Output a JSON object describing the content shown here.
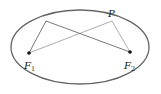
{
  "diagram": {
    "type": "ellipse-foci",
    "ellipse": {
      "cx": 80,
      "cy": 47,
      "rx": 69,
      "ry": 37,
      "stroke": "#666666"
    },
    "points": {
      "F1": {
        "x": 29,
        "y": 53,
        "label": "F",
        "subscript": "1"
      },
      "F2": {
        "x": 130,
        "y": 52,
        "label": "F",
        "subscript": "2"
      },
      "P": {
        "x": 112,
        "y": 21,
        "label": "P"
      },
      "Q": {
        "x": 46,
        "y": 21
      }
    },
    "segments": [
      [
        "F1",
        "Q"
      ],
      [
        "Q",
        "F2"
      ],
      [
        "F1",
        "P"
      ],
      [
        "P",
        "F2"
      ]
    ],
    "colors": {
      "line": "#555555",
      "point": "#111111"
    }
  }
}
